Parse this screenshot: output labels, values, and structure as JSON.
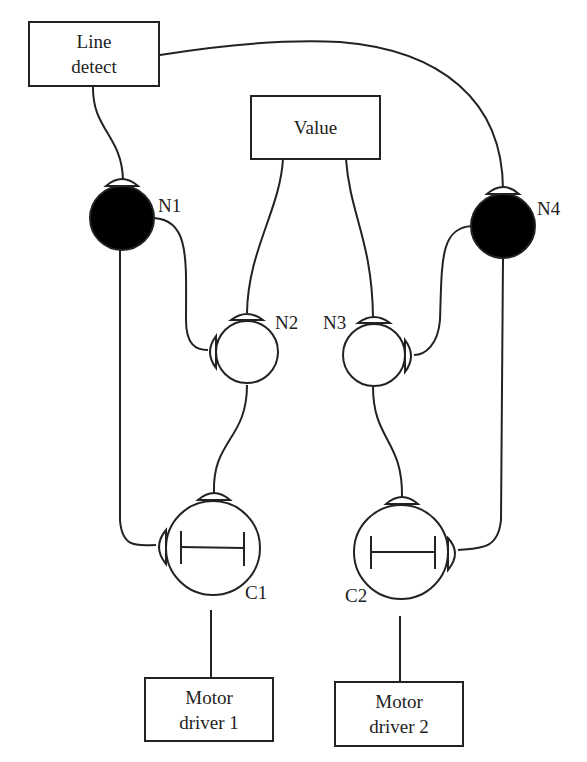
{
  "diagram": {
    "type": "neural-circuit",
    "boxes": {
      "line_detect": {
        "line1": "Line",
        "line2": "detect"
      },
      "value": {
        "line1": "Value"
      },
      "motor1": {
        "line1": "Motor",
        "line2": "driver 1"
      },
      "motor2": {
        "line1": "Motor",
        "line2": "driver 2"
      }
    },
    "neurons": {
      "n1": {
        "label": "N1",
        "fill": "#000000"
      },
      "n2": {
        "label": "N2",
        "fill": "#ffffff"
      },
      "n3": {
        "label": "N3",
        "fill": "#ffffff"
      },
      "n4": {
        "label": "N4",
        "fill": "#000000"
      },
      "c1": {
        "label": "C1",
        "fill": "#ffffff"
      },
      "c2": {
        "label": "C2",
        "fill": "#ffffff"
      }
    },
    "connections": [
      {
        "from": "Line detect",
        "to": "N1"
      },
      {
        "from": "Line detect",
        "to": "N4"
      },
      {
        "from": "Value",
        "to": "N2"
      },
      {
        "from": "Value",
        "to": "N3"
      },
      {
        "from": "N1",
        "to": "N2"
      },
      {
        "from": "N1",
        "to": "C1"
      },
      {
        "from": "N4",
        "to": "N3"
      },
      {
        "from": "N4",
        "to": "C2"
      },
      {
        "from": "N2",
        "to": "C1"
      },
      {
        "from": "N3",
        "to": "C2"
      },
      {
        "from": "C1",
        "to": "Motor driver 1"
      },
      {
        "from": "C2",
        "to": "Motor driver 2"
      }
    ]
  }
}
